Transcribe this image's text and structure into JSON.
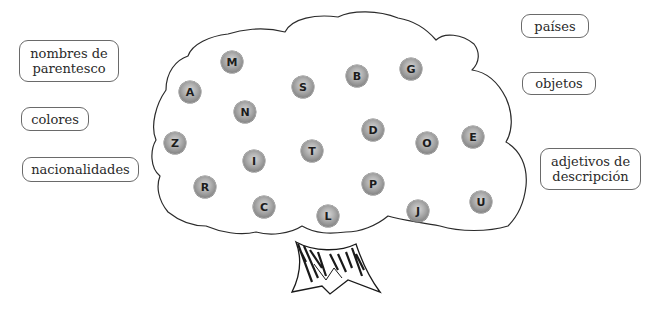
{
  "categories": [
    {
      "id": "nombres-de-parentesco",
      "text": "nombres de parentesco",
      "lines": [
        "nombres de",
        "parentesco"
      ],
      "x": 19,
      "y": 40,
      "w": 100,
      "h": 42
    },
    {
      "id": "colores",
      "text": "colores",
      "lines": [
        "colores"
      ],
      "x": 21,
      "y": 107,
      "w": 68,
      "h": 24
    },
    {
      "id": "nacionalidades",
      "text": "nacionalidades",
      "lines": [
        "nacionalidades"
      ],
      "x": 22,
      "y": 157,
      "w": 117,
      "h": 25
    },
    {
      "id": "paises",
      "text": "países",
      "lines": [
        "países"
      ],
      "x": 521,
      "y": 14,
      "w": 68,
      "h": 24
    },
    {
      "id": "objetos",
      "text": "objetos",
      "lines": [
        "objetos"
      ],
      "x": 522,
      "y": 72,
      "w": 74,
      "h": 23
    },
    {
      "id": "adjetivos-de-descripcion",
      "text": "adjetivos de descripción",
      "lines": [
        "adjetivos de",
        "descripción"
      ],
      "x": 540,
      "y": 148,
      "w": 101,
      "h": 42
    }
  ],
  "letters": [
    {
      "letter": "M",
      "x": 232,
      "y": 62
    },
    {
      "letter": "A",
      "x": 190,
      "y": 92
    },
    {
      "letter": "N",
      "x": 245,
      "y": 112
    },
    {
      "letter": "S",
      "x": 303,
      "y": 87
    },
    {
      "letter": "B",
      "x": 357,
      "y": 76
    },
    {
      "letter": "G",
      "x": 411,
      "y": 69
    },
    {
      "letter": "Z",
      "x": 175,
      "y": 143
    },
    {
      "letter": "I",
      "x": 254,
      "y": 161
    },
    {
      "letter": "T",
      "x": 312,
      "y": 151
    },
    {
      "letter": "D",
      "x": 373,
      "y": 130
    },
    {
      "letter": "O",
      "x": 427,
      "y": 143
    },
    {
      "letter": "E",
      "x": 473,
      "y": 137
    },
    {
      "letter": "R",
      "x": 205,
      "y": 187
    },
    {
      "letter": "P",
      "x": 373,
      "y": 184
    },
    {
      "letter": "C",
      "x": 264,
      "y": 207
    },
    {
      "letter": "L",
      "x": 328,
      "y": 216
    },
    {
      "letter": "J",
      "x": 418,
      "y": 211
    },
    {
      "letter": "U",
      "x": 481,
      "y": 202
    }
  ],
  "colors": {
    "outline": "#2b2b2b",
    "ball_light": "#d6d6d6",
    "ball_dark": "#6a6a6a",
    "label_border": "#6a6a6a",
    "text": "#2a2a2a"
  }
}
